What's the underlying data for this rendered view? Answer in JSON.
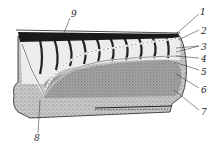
{
  "diagram": {
    "type": "anatomical-cross-section",
    "labels": [
      {
        "id": "1",
        "text": "1"
      },
      {
        "id": "2",
        "text": "2"
      },
      {
        "id": "3",
        "text": "3"
      },
      {
        "id": "4",
        "text": "4"
      },
      {
        "id": "5",
        "text": "5"
      },
      {
        "id": "6",
        "text": "6"
      },
      {
        "id": "7",
        "text": "7"
      },
      {
        "id": "8",
        "text": "8"
      },
      {
        "id": "9",
        "text": "9"
      }
    ],
    "colors": {
      "ink": "#222222",
      "stipple": "#8a8a8a",
      "segment_fill": "#e8e8e8",
      "background": "#ffffff"
    }
  }
}
